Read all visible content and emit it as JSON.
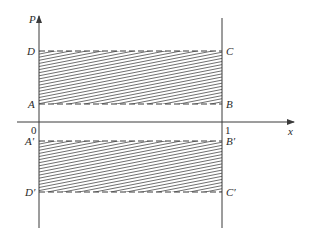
{
  "diagram": {
    "axes": {
      "y_label": "P",
      "x_label": "x",
      "origin_label": "0",
      "x_tick_label": "1"
    },
    "upper_region": {
      "corners": {
        "top_left": "D",
        "top_right": "C",
        "bottom_left": "A",
        "bottom_right": "B"
      },
      "fill": "hatched"
    },
    "lower_region": {
      "corners": {
        "top_left": "A′",
        "top_right": "B′",
        "bottom_left": "D′",
        "bottom_right": "C′"
      },
      "fill": "hatched"
    },
    "colors": {
      "line": "#3a3a3a",
      "background": "#ffffff"
    }
  }
}
